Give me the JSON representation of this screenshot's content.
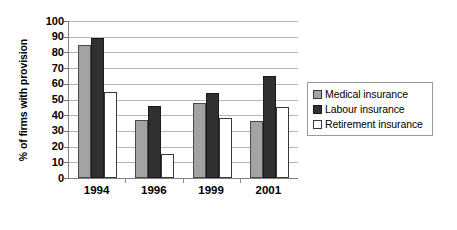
{
  "chart_data": {
    "type": "bar",
    "title": "",
    "subtitle": "",
    "xlabel": "",
    "ylabel": "% of firms with provision",
    "categories": [
      "1994",
      "1996",
      "1999",
      "2001"
    ],
    "series": [
      {
        "name": "Medical insurance",
        "color": "#a3a3a3",
        "values": [
          85,
          37,
          48,
          36
        ]
      },
      {
        "name": "Labour insurance",
        "color": "#303030",
        "values": [
          89,
          46,
          54,
          65
        ]
      },
      {
        "name": "Retirement insurance",
        "color": "#ffffff",
        "values": [
          55,
          15,
          38,
          45
        ]
      }
    ],
    "ylim": [
      0,
      100
    ],
    "ytick_step": 10,
    "yticks": [
      "0",
      "10",
      "20",
      "30",
      "40",
      "50",
      "60",
      "70",
      "80",
      "90",
      "100"
    ],
    "grid": true,
    "grid_axis": "y",
    "legend_position": "right",
    "legend_entries": [
      "Medical insurance",
      "Labour insurance",
      "Retirement insurance"
    ],
    "annotations": []
  }
}
